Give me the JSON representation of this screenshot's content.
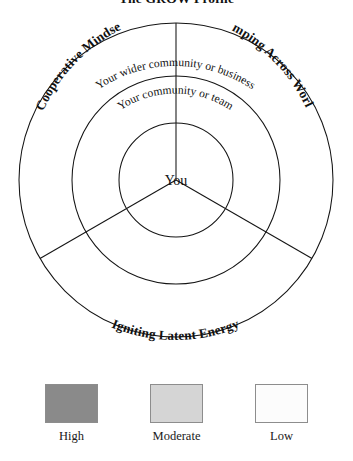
{
  "figure": {
    "title": "The GROW Profile"
  },
  "diagram": {
    "type": "concentric-rings",
    "center_label": "You",
    "rings": [
      {
        "id": "inner",
        "label": "You"
      },
      {
        "id": "middle",
        "label": "Your community or team"
      },
      {
        "id": "outer",
        "label": "Your wider community or business"
      }
    ],
    "sectors": [
      {
        "id": "left",
        "label": "Cooperative Mindset"
      },
      {
        "id": "right",
        "label": "Jumping Across Worlds"
      },
      {
        "id": "bottom",
        "label": "Igniting Latent Energy"
      }
    ],
    "ring_labels": {
      "outer": "Your wider community or business",
      "middle": "Your community or team",
      "center": "You"
    },
    "sector_labels": {
      "left": "Cooperative Mindset",
      "right": "Jumping Across Worlds",
      "bottom": "Igniting Latent Energy"
    }
  },
  "legend": {
    "items": [
      {
        "label": "High",
        "color": "#8a8a8a"
      },
      {
        "label": "Moderate",
        "color": "#d5d5d5"
      },
      {
        "label": "Low",
        "color": "#fcfcfc"
      }
    ]
  }
}
